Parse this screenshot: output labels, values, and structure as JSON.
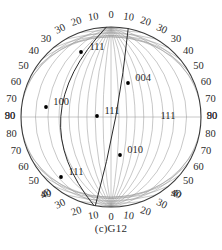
{
  "figure": {
    "type": "stereographic-projection",
    "caption": "(c)G12",
    "net": {
      "center_x": 111,
      "center_y": 117,
      "radius": 90,
      "primitive_circle_color": "#3a3a3a",
      "grid_color": "#9a9a9a",
      "trace_color": "#2a2a2a",
      "pole_color": "#000000",
      "grid_step_degrees": 10
    },
    "axis_labels": {
      "top": [
        "30",
        "20",
        "10",
        "0",
        "10",
        "20",
        "30"
      ],
      "bottom": [
        "40",
        "30",
        "20",
        "10",
        "0",
        "10",
        "20",
        "30",
        "40"
      ],
      "left": [
        "40",
        "50",
        "60",
        "70",
        "80",
        "90",
        "80",
        "70",
        "60",
        "50",
        "40",
        "30"
      ],
      "right": [
        "40",
        "50",
        "60",
        "70",
        "80",
        "90",
        "80",
        "70",
        "60",
        "50",
        "40",
        "30"
      ]
    },
    "poles": [
      {
        "label": "111",
        "x": 81,
        "y": 52,
        "lx": 97,
        "ly": 48
      },
      {
        "label": "004",
        "x": 128,
        "y": 83,
        "lx": 143,
        "ly": 79
      },
      {
        "label": "100",
        "x": 46,
        "y": 107,
        "lx": 61,
        "ly": 103
      },
      {
        "label": "111",
        "x": 97,
        "y": 116,
        "lx": 112,
        "ly": 112
      },
      {
        "label": "111",
        "x": null,
        "y": null,
        "lx": 168,
        "ly": 117
      },
      {
        "label": "010",
        "x": 120,
        "y": 155,
        "lx": 135,
        "ly": 151
      },
      {
        "label": "111",
        "x": 61,
        "y": 177,
        "lx": 76,
        "ly": 173
      }
    ],
    "traces": [
      {
        "name": "trace-left",
        "top_offset_deg": -3,
        "bottom_offset_deg": -11,
        "bulge_deg": -34
      },
      {
        "name": "trace-right",
        "top_offset_deg": 11,
        "bottom_offset_deg": -10,
        "bulge_deg": 3
      }
    ]
  }
}
